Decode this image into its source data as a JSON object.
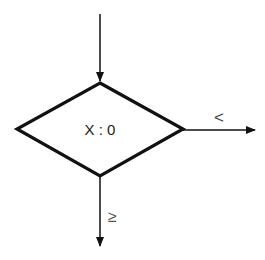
{
  "diagram": {
    "type": "flowchart-decision",
    "decision": {
      "label": "X : 0",
      "shape": "diamond"
    },
    "branches": [
      {
        "id": "right",
        "label": "<",
        "direction": "right"
      },
      {
        "id": "down",
        "label": "≥",
        "direction": "down"
      }
    ],
    "entry": {
      "direction": "from-top"
    },
    "colors": {
      "stroke": "#111111",
      "background": "#ffffff"
    }
  }
}
